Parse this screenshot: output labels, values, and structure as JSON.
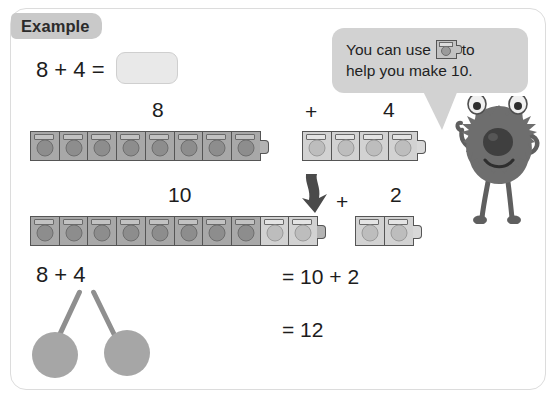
{
  "badge": {
    "label": "Example"
  },
  "equation": {
    "prompt": "8 + 4 =",
    "answer_value": "",
    "answer_placeholder": ""
  },
  "labels": {
    "train8": "8",
    "plus_top": "+",
    "train4": "4",
    "train10": "10",
    "plus_bottom": "+",
    "train2": "2"
  },
  "working": {
    "bond_expression": "8 + 4",
    "line1": "= 10 + 2",
    "line2": "= 12"
  },
  "bubble": {
    "line1_before": "You can use",
    "line1_after": "to",
    "line2": "help you make 10.",
    "icon": "linking-cube-icon"
  },
  "cube_trains": {
    "train8": {
      "count": 8,
      "shades": [
        "dark",
        "dark",
        "dark",
        "dark",
        "dark",
        "dark",
        "dark",
        "dark"
      ]
    },
    "train4": {
      "count": 4,
      "shades": [
        "light",
        "light",
        "light",
        "light"
      ]
    },
    "train10": {
      "count": 10,
      "shades": [
        "dark",
        "dark",
        "dark",
        "dark",
        "dark",
        "dark",
        "dark",
        "dark",
        "light",
        "light"
      ]
    },
    "train2": {
      "count": 2,
      "shades": [
        "light",
        "light"
      ]
    }
  },
  "number_bond": {
    "top_expression": "8 + 4",
    "left_circle_value": "",
    "right_circle_value": ""
  },
  "colors": {
    "card_border": "#dcdcdc",
    "badge_bg": "#c9c9c9",
    "cube_dark": "#a8a8a8",
    "cube_light": "#d2d2d2",
    "cube_outline": "#555555",
    "bubble_bg": "#d2d2d2",
    "monster_body": "#6e6e6e",
    "bond_circle": "#a6a6a6",
    "text": "#1d1d1d",
    "answer_box_bg": "#e9e9e9"
  }
}
